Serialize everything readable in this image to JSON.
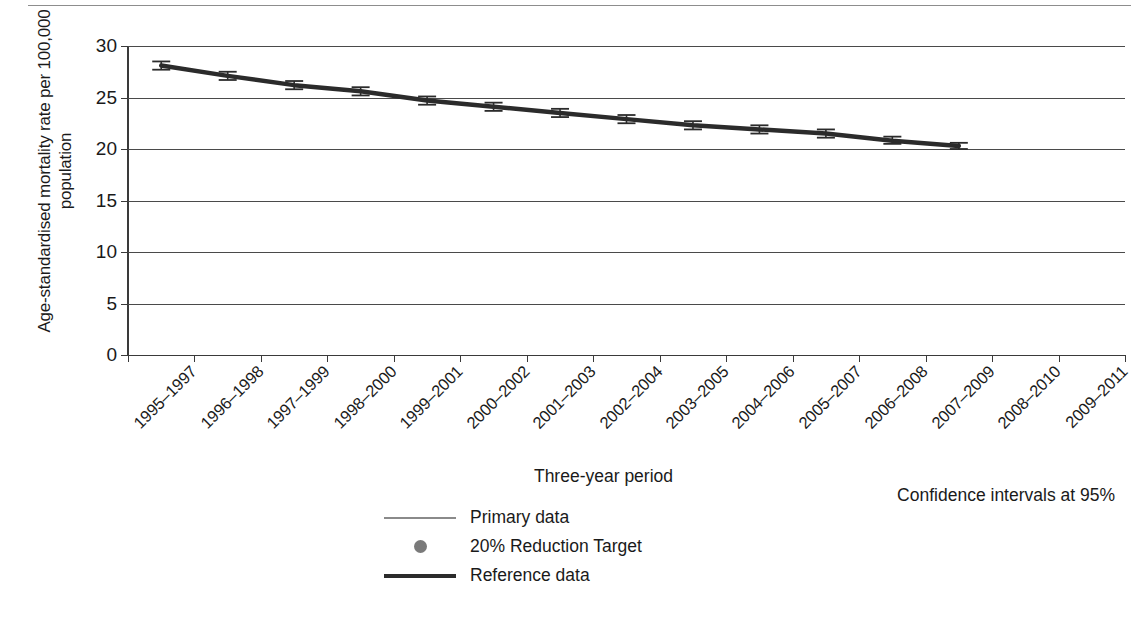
{
  "chart_data": {
    "type": "line",
    "title": "",
    "xlabel": "Three-year period",
    "ylabel": "Age-standardised mortality rate per 100,000 population",
    "ylim": [
      0,
      30
    ],
    "yticks": [
      0,
      5,
      10,
      15,
      20,
      25,
      30
    ],
    "grid": true,
    "legend_position": "bottom-center",
    "annotation": "Confidence intervals at 95%",
    "categories": [
      "1995–1997",
      "1996–1998",
      "1997–1999",
      "1998–2000",
      "1999–2001",
      "2000–2002",
      "2001–2003",
      "2002–2004",
      "2003–2005",
      "2004–2006",
      "2005–2007",
      "2006–2008",
      "2007–2009",
      "2008–2010",
      "2009–2011"
    ],
    "series": [
      {
        "name": "Reference data",
        "style": "thick-line-with-error-bars",
        "values": [
          28.1,
          27.1,
          26.2,
          25.6,
          24.7,
          24.1,
          23.5,
          22.9,
          22.3,
          21.9,
          21.5,
          20.8,
          20.3,
          null,
          null
        ],
        "ci_low": [
          27.7,
          26.7,
          25.8,
          25.2,
          24.3,
          23.7,
          23.1,
          22.5,
          21.9,
          21.5,
          21.1,
          20.5,
          20.0,
          null,
          null
        ],
        "ci_high": [
          28.5,
          27.5,
          26.6,
          26.0,
          25.1,
          24.5,
          23.9,
          23.3,
          22.7,
          22.3,
          21.9,
          21.2,
          20.6,
          null,
          null
        ]
      },
      {
        "name": "Primary data",
        "style": "thin-line",
        "values": [
          null,
          null,
          null,
          null,
          null,
          null,
          null,
          null,
          null,
          null,
          null,
          null,
          null,
          null,
          null
        ]
      },
      {
        "name": "20% Reduction Target",
        "style": "dot-marker",
        "values": [
          null,
          null,
          null,
          null,
          null,
          null,
          null,
          null,
          null,
          null,
          null,
          null,
          null,
          null,
          null
        ]
      }
    ]
  },
  "legend": {
    "items": [
      {
        "label": "Primary data",
        "key": "thin-line-key",
        "color": "#8a8a8a"
      },
      {
        "label": "20% Reduction Target",
        "key": "dot-key",
        "color": "#7a7a7a"
      },
      {
        "label": "Reference data",
        "key": "thick-line-key",
        "color": "#2b2b2b"
      }
    ]
  },
  "axes": {
    "y_title": "Age-standardised mortality rate per 100,000 population",
    "x_title": "Three-year period"
  },
  "note": "Confidence intervals at 95%"
}
